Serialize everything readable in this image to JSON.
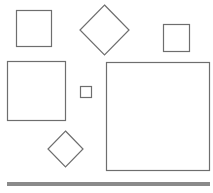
{
  "canvas": {
    "width": 213,
    "height": 193,
    "background": "#ffffff"
  },
  "colors": {
    "stroke": "#6e6e6e",
    "bar": "#8a8a8a"
  },
  "shapes": [
    {
      "id": "square-top-left",
      "type": "square",
      "x": 16,
      "y": 10,
      "w": 35,
      "h": 36
    },
    {
      "id": "diamond-top-center",
      "type": "diamond",
      "cx": 104.5,
      "cy": 30,
      "rx": 24.5,
      "ry": 25
    },
    {
      "id": "square-top-right",
      "type": "square",
      "x": 163,
      "y": 24,
      "w": 26,
      "h": 27
    },
    {
      "id": "square-middle-left",
      "type": "square",
      "x": 7,
      "y": 61,
      "w": 58,
      "h": 59
    },
    {
      "id": "square-small-center",
      "type": "square",
      "x": 80,
      "y": 86,
      "w": 11,
      "h": 11
    },
    {
      "id": "square-large-right",
      "type": "square",
      "x": 106,
      "y": 62,
      "w": 103,
      "h": 108
    },
    {
      "id": "diamond-bottom-left",
      "type": "diamond",
      "cx": 65.5,
      "cy": 149,
      "rx": 17.5,
      "ry": 18
    }
  ],
  "bar": {
    "x": 7,
    "y": 182,
    "w": 203,
    "h": 4
  }
}
